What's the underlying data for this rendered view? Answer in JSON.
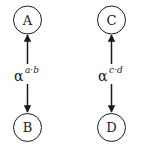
{
  "diagram": {
    "left": {
      "top_node": "A",
      "bottom_node": "B",
      "edge_label": "α",
      "edge_superscript": "a·b"
    },
    "right": {
      "top_node": "C",
      "bottom_node": "D",
      "edge_label": "α",
      "edge_superscript": "c·d"
    }
  }
}
